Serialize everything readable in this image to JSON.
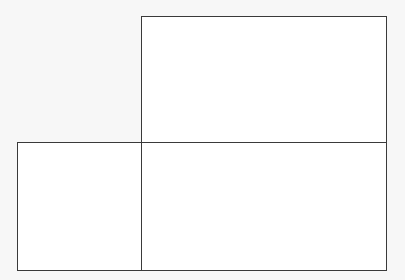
{
  "puzzle": {
    "type": "nonogram",
    "columns": 10,
    "rows": 5,
    "colors": {
      "dark": "#2b2b2b",
      "mid": "#6b6b6b",
      "empty": "#ffffff",
      "grid_line": "#bdbdbd",
      "border": "#3a3a3a"
    },
    "top_clues": [
      [
        null,
        null,
        null,
        null,
        {
          "v": "1",
          "s": "mid"
        }
      ],
      [
        null,
        null,
        null,
        null,
        {
          "v": "2",
          "s": "mid"
        }
      ],
      [
        null,
        null,
        null,
        {
          "v": "1",
          "s": "mid"
        },
        {
          "v": "2",
          "s": "dark"
        }
      ],
      [
        null,
        null,
        {
          "v": "1",
          "s": "dark"
        },
        {
          "v": "1",
          "s": "mid"
        },
        {
          "v": "2",
          "s": "dark"
        }
      ],
      [
        null,
        null,
        {
          "v": "1",
          "s": "mid"
        },
        {
          "v": "1",
          "s": "dark"
        },
        {
          "v": "2",
          "s": "mid"
        }
      ],
      [
        null,
        null,
        {
          "v": "1",
          "s": "mid"
        },
        {
          "v": "1",
          "s": "dark"
        },
        {
          "v": "2",
          "s": "mid"
        }
      ],
      [
        null,
        {
          "v": "1",
          "s": "mid"
        },
        {
          "v": "1",
          "s": "dark"
        },
        {
          "v": "1",
          "s": "mid"
        },
        {
          "v": "2",
          "s": "dark"
        }
      ],
      [
        null,
        null,
        {
          "v": "1",
          "s": "dark"
        },
        {
          "v": "1",
          "s": "mid"
        },
        {
          "v": "2",
          "s": "dark"
        }
      ],
      [
        null,
        null,
        null,
        null,
        {
          "v": "2",
          "s": "mid"
        }
      ],
      [
        null,
        null,
        null,
        null,
        {
          "v": "3",
          "s": "mid"
        }
      ]
    ],
    "left_clues": [
      [
        null,
        null,
        null,
        null,
        {
          "v": "3",
          "s": "mid"
        }
      ],
      [
        null,
        null,
        null,
        {
          "v": "5",
          "s": "dark"
        },
        {
          "v": "1",
          "s": "mid"
        }
      ],
      [
        null,
        null,
        null,
        null,
        {
          "v": "9",
          "s": "mid"
        }
      ],
      [
        {
          "v": "2",
          "s": "mid"
        },
        {
          "v": "2",
          "s": "dark"
        },
        {
          "v": "2",
          "s": "mid"
        },
        {
          "v": "2",
          "s": "dark"
        },
        {
          "v": "2",
          "s": "mid"
        }
      ],
      [
        null,
        null,
        null,
        {
          "v": "2",
          "s": "dark"
        },
        {
          "v": "2",
          "s": "dark"
        }
      ]
    ]
  }
}
